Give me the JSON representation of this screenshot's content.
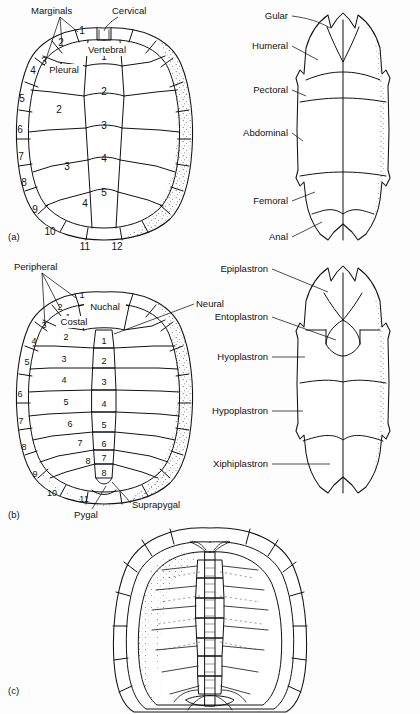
{
  "figure": {
    "background_color": "#fdfdfd",
    "ink_color": "#111111"
  },
  "panels": [
    {
      "id": "a",
      "marker": "(a)",
      "caption_position": "bottom-left",
      "left_figure": {
        "name": "carapace-scutes",
        "description": "Dorsal view of carapace showing horny scutes",
        "labels": [
          {
            "text": "Marginals",
            "role": "scute-group"
          },
          {
            "text": "Cervical",
            "role": "scute"
          },
          {
            "text": "Vertebral",
            "role": "scute-series"
          },
          {
            "text": "Pleural",
            "role": "scute-series"
          }
        ],
        "vertebral_numbers": [
          "1",
          "2",
          "3",
          "4",
          "5"
        ],
        "pleural_numbers": [
          "1",
          "2",
          "3",
          "4"
        ],
        "marginal_numbers": [
          "1",
          "2",
          "3",
          "4",
          "5",
          "6",
          "7",
          "8",
          "9",
          "10",
          "11",
          "12"
        ]
      },
      "right_figure": {
        "name": "plastron-scutes",
        "description": "Ventral view of plastron showing horny scutes",
        "labels": [
          "Gular",
          "Humeral",
          "Pectoral",
          "Abdominal",
          "Femoral",
          "Anal"
        ]
      }
    },
    {
      "id": "b",
      "marker": "(b)",
      "caption_position": "bottom-left",
      "left_figure": {
        "name": "carapace-bones",
        "description": "Dorsal view of carapace showing bony elements",
        "labels": [
          {
            "text": "Peripheral",
            "role": "bone-group"
          },
          {
            "text": "Nuchal",
            "role": "bone"
          },
          {
            "text": "Neural",
            "role": "bone-series"
          },
          {
            "text": "Costal",
            "role": "bone-series"
          },
          {
            "text": "Pygal",
            "role": "bone"
          },
          {
            "text": "Suprapygal",
            "role": "bone"
          }
        ],
        "neural_numbers": [
          "1",
          "2",
          "3",
          "4",
          "5",
          "6",
          "7",
          "8"
        ],
        "costal_numbers": [
          "1",
          "2",
          "3",
          "4",
          "5",
          "6",
          "7",
          "8"
        ],
        "peripheral_numbers": [
          "1",
          "2",
          "3",
          "4",
          "5",
          "6",
          "7",
          "8",
          "9",
          "10",
          "11"
        ]
      },
      "right_figure": {
        "name": "plastron-bones",
        "description": "Ventral view of plastron showing bony elements",
        "labels": [
          "Epiplastron",
          "Entoplastron",
          "Hyoplastron",
          "Hypoplastron",
          "Xiphiplastron"
        ]
      }
    },
    {
      "id": "c",
      "marker": "(c)",
      "caption_position": "bottom-left",
      "figure": {
        "name": "carapace-internal",
        "description": "Internal view of carapace showing vertebral column and ribs",
        "labels": []
      }
    }
  ]
}
